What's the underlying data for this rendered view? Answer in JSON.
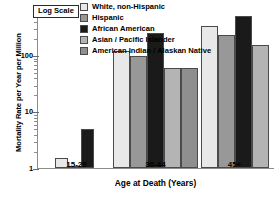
{
  "chart_data": {
    "type": "bar",
    "title": "",
    "xlabel": "Age at Death (Years)",
    "ylabel": "Mortality Rate per Year per Million",
    "scale_note": "Log Scale",
    "yscale": "log",
    "ylim": [
      1,
      600
    ],
    "ytick_labels": [
      "1",
      "10",
      "100"
    ],
    "ytick_values": [
      1,
      10,
      100
    ],
    "grid": false,
    "legend_position": "top-right",
    "categories": [
      "15-29",
      "30-44",
      "45+"
    ],
    "series": [
      {
        "name": "White, non-Hispanic",
        "color": "#e8e8e8",
        "values": [
          1.5,
          120,
          330
        ]
      },
      {
        "name": "Hispanic",
        "color": "#989898",
        "values": [
          1.05,
          95,
          230
        ]
      },
      {
        "name": "African American",
        "color": "#1a1a1a",
        "values": [
          5,
          250,
          490
        ]
      },
      {
        "name": "Asian / Pacific Islander",
        "color": "#b4b4b4",
        "values": [
          null,
          58,
          150
        ]
      },
      {
        "name": "American Indian / Alaskan Native",
        "color": "#8f8f8f",
        "values": [
          null,
          58,
          null
        ]
      }
    ]
  },
  "legend": {
    "items": [
      {
        "label": "White, non-Hispanic",
        "color": "#e8e8e8"
      },
      {
        "label": "Hispanic",
        "color": "#989898"
      },
      {
        "label": "African American",
        "color": "#1a1a1a"
      },
      {
        "label": "Asian / Pacific Islander",
        "color": "#b4b4b4"
      },
      {
        "label": "American Indian / Alaskan Native",
        "color": "#8f8f8f"
      }
    ]
  }
}
